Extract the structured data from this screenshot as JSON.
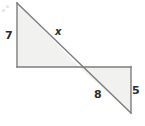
{
  "figure": {
    "background_color": "#ffffff",
    "fill_color": "#f1f1ef",
    "stroke_color": "#7d7d7d",
    "label_color": "#2b2b2b",
    "canvas": {
      "width": 145,
      "height": 126
    }
  },
  "shapes": {
    "upper_triangle": {
      "name": "upper-left-triangle",
      "points": "17,3 17,67 79,67",
      "vertices": [
        {
          "name": "apex-top-left",
          "x": 17,
          "y": 3
        },
        {
          "name": "right-angle-bottom-left",
          "x": 17,
          "y": 67
        },
        {
          "name": "crossing-point",
          "x": 79,
          "y": 67
        }
      ]
    },
    "lower_triangle": {
      "name": "lower-right-triangle",
      "points": "79,67 131,67 131,113",
      "vertices": [
        {
          "name": "crossing-point",
          "x": 79,
          "y": 67
        },
        {
          "name": "right-angle-top-right",
          "x": 131,
          "y": 67
        },
        {
          "name": "apex-bottom-right",
          "x": 131,
          "y": 113
        }
      ]
    },
    "diagonal": {
      "name": "shared-diagonal-line",
      "x1": 17,
      "y1": 3,
      "x2": 131,
      "y2": 113
    },
    "horizontal": {
      "name": "shared-horizontal-line",
      "x1": 17,
      "y1": 67,
      "x2": 131,
      "y2": 67
    },
    "left_vertical": {
      "name": "left-vertical-edge",
      "x1": 17,
      "y1": 3,
      "x2": 17,
      "y2": 67
    },
    "right_vertical": {
      "name": "right-vertical-edge",
      "x1": 131,
      "y1": 67,
      "x2": 131,
      "y2": 113
    }
  },
  "labels": {
    "left_side": "7",
    "hypotenuse_upper": "x",
    "bottom_side": "8",
    "right_side": "5"
  }
}
